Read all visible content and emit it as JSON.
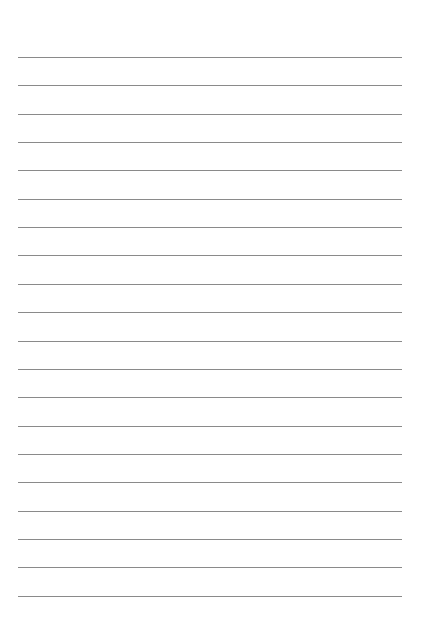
{
  "page": {
    "type": "lined-paper",
    "line_count": 20,
    "first_line_y": 57,
    "line_spacing": 28.35,
    "line_left": 18,
    "line_width": 384,
    "line_color": "#8a8a8a",
    "background": "#ffffff"
  }
}
